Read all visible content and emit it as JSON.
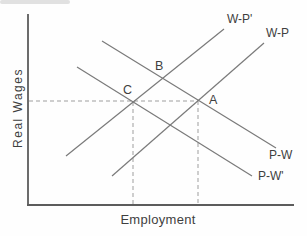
{
  "figure": {
    "y_axis_label": "Real Wages",
    "x_axis_label": "Employment",
    "curves": [
      {
        "label": "W-P'",
        "slope": "upward",
        "position": "upper-left, through points C and B"
      },
      {
        "label": "W-P",
        "slope": "upward",
        "position": "lower-right, through point A"
      },
      {
        "label": "P-W",
        "slope": "downward",
        "position": "upper, through points B and A"
      },
      {
        "label": "P-W'",
        "slope": "downward",
        "position": "lower, through point C"
      }
    ],
    "points": [
      {
        "label": "A",
        "description": "intersection of W-P and P-W, on horizontal dashed guide"
      },
      {
        "label": "B",
        "description": "intersection of W-P' and P-W, above guide"
      },
      {
        "label": "C",
        "description": "intersection of W-P' and P-W', on horizontal dashed guide"
      }
    ],
    "guides": {
      "horizontal": "dashed line from Real Wages axis through C to A",
      "vertical": "dashed lines from C and from A down to Employment axis"
    },
    "colors": {
      "background": "#fefefe",
      "axis": "#5c5c5c",
      "curve": "#7a7a7a",
      "dashed": "#9e9e9e",
      "text": "#3f3f3f"
    }
  }
}
